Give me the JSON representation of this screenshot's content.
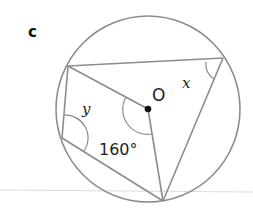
{
  "diagram": {
    "part_label": "c",
    "center_label": "O",
    "angle_x_label": "x",
    "angle_y_label": "y",
    "central_angle_label": "160°",
    "colors": {
      "stroke": "#8c8c8c",
      "text": "#222222",
      "rule": "#d9d9d9",
      "dot": "#111111"
    }
  }
}
